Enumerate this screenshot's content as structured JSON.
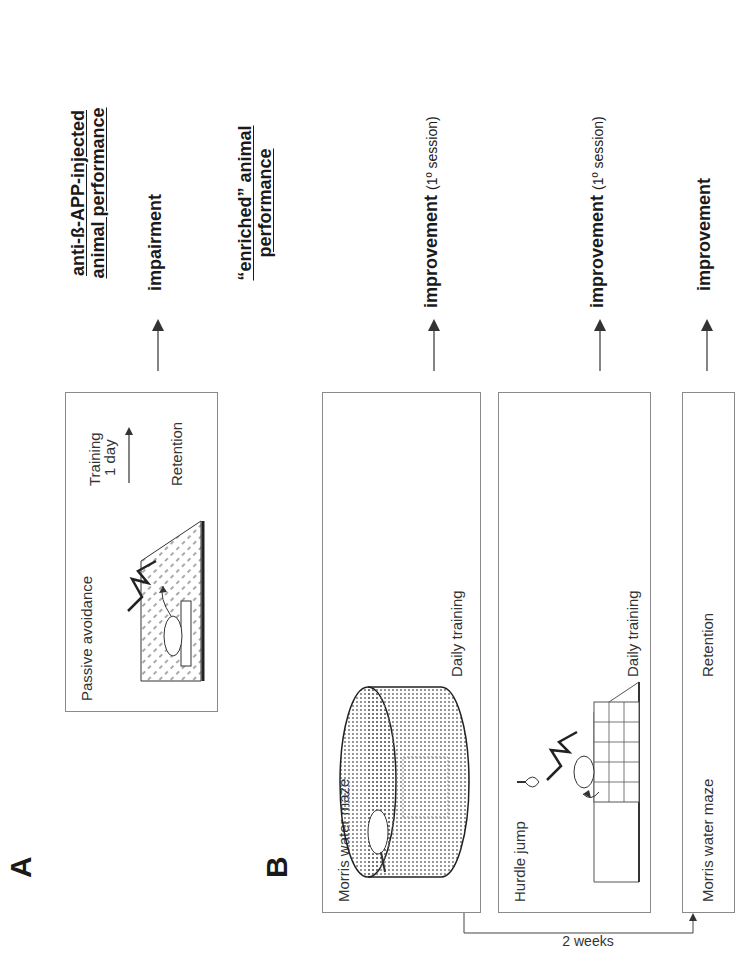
{
  "figure": {
    "orientation": "rotated 90 degrees counter-clockwise",
    "panel_a": {
      "letter": "A",
      "header_line1": "anti-ß-APP-injected",
      "header_line2": "animal performance",
      "box": {
        "title": "Passive avoidance",
        "training_label": "Training",
        "interval_label": "1 day",
        "retention_label": "Retention"
      },
      "result": "impairment"
    },
    "panel_b": {
      "letter": "B",
      "header_line1": "“enriched” animal",
      "header_line2": "performance",
      "rows": [
        {
          "title": "Morris water maze",
          "note": "Daily training",
          "result": "improvement",
          "result_suffix": "(1º session)"
        },
        {
          "title": "Hurdle jump",
          "note": "Daily training",
          "result": "improvement",
          "result_suffix": "(1º session)"
        },
        {
          "title": "Morris water maze",
          "note": "Retention",
          "result": "improvement",
          "result_suffix": ""
        }
      ],
      "connector_label": "2 weeks"
    },
    "colors": {
      "text": "#1a1a1a",
      "box_border": "#8a8a8a",
      "arrow": "#333333",
      "background": "#ffffff"
    }
  }
}
